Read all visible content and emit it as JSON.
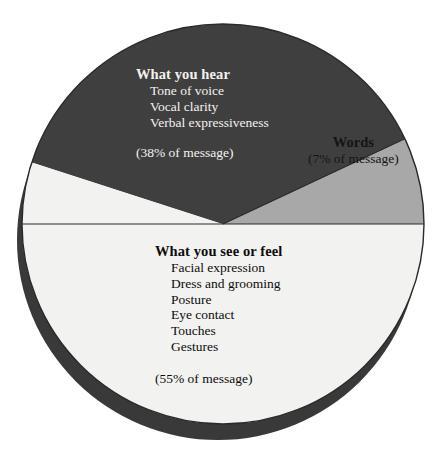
{
  "chart_data": {
    "type": "pie",
    "title": "",
    "subtitle": "",
    "xlabel": "",
    "ylabel": "",
    "legend_position": "in-slice-labels",
    "grid": false,
    "total": 100,
    "units": "% of message",
    "categories": [
      "What you see or feel",
      "What you hear",
      "Words"
    ],
    "values": [
      55,
      38,
      7
    ],
    "slices": [
      {
        "name": "what-you-see-or-feel",
        "heading": "What you see or feel",
        "value": 55,
        "percent_label": "(55% of message)",
        "color": "#f2f2f0",
        "text_color": "#0c0c0c",
        "start_angle_deg": 0,
        "end_angle_deg": 198,
        "items": [
          "Facial expression",
          "Dress and grooming",
          "Posture",
          "Eye contact",
          "Touches",
          "Gestures"
        ]
      },
      {
        "name": "what-you-hear",
        "heading": "What you hear",
        "value": 38,
        "percent_label": "(38% of message)",
        "color": "#403f40",
        "text_color": "#f4f2ef",
        "start_angle_deg": 198,
        "end_angle_deg": 334.8,
        "items": [
          "Tone of voice",
          "Vocal clarity",
          "Verbal expressiveness"
        ]
      },
      {
        "name": "words",
        "heading": "Words",
        "value": 7,
        "percent_label": "(7% of message)",
        "color": "#a8a8a8",
        "text_color": "#141414",
        "start_angle_deg": 334.8,
        "end_angle_deg": 360,
        "items": []
      }
    ],
    "style": {
      "outline_color": "#2b2a2b",
      "shadow_color": "#3a393a",
      "background": "#ffffff"
    }
  }
}
